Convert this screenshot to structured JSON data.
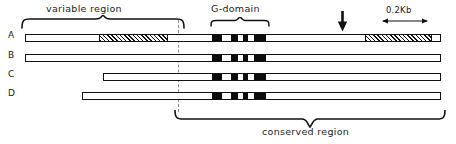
{
  "figure": {
    "title_labels": {
      "variable_region": "variable region",
      "g_domain": "G-domain",
      "conserved_region": "conserved region",
      "scale": "0.2Kb"
    },
    "rows": [
      {
        "id": "A",
        "label": "A",
        "bar": {
          "left": 25,
          "width": 416,
          "top": 34
        },
        "segments": [
          {
            "kind": "hatch",
            "left": 73,
            "width": 67
          },
          {
            "kind": "black",
            "left": 186,
            "width": 10
          },
          {
            "kind": "black",
            "left": 205,
            "width": 7
          },
          {
            "kind": "black",
            "left": 217,
            "width": 5
          },
          {
            "kind": "black",
            "left": 228,
            "width": 12
          },
          {
            "kind": "hatch",
            "left": 339,
            "width": 65
          }
        ]
      },
      {
        "id": "B",
        "label": "B",
        "bar": {
          "left": 25,
          "width": 416,
          "top": 54
        },
        "segments": [
          {
            "kind": "black",
            "left": 186,
            "width": 10
          },
          {
            "kind": "black",
            "left": 205,
            "width": 7
          },
          {
            "kind": "black",
            "left": 217,
            "width": 5
          },
          {
            "kind": "black",
            "left": 228,
            "width": 12
          }
        ]
      },
      {
        "id": "C",
        "label": "C",
        "bar": {
          "left": 103,
          "width": 338,
          "top": 73
        },
        "segments": [
          {
            "kind": "black",
            "left": 108,
            "width": 10
          },
          {
            "kind": "black",
            "left": 127,
            "width": 7
          },
          {
            "kind": "black",
            "left": 139,
            "width": 5
          },
          {
            "kind": "black",
            "left": 150,
            "width": 12
          }
        ]
      },
      {
        "id": "D",
        "label": "D",
        "bar": {
          "left": 82,
          "width": 359,
          "top": 92
        },
        "segments": [
          {
            "kind": "black",
            "left": 129,
            "width": 10
          },
          {
            "kind": "black",
            "left": 148,
            "width": 7
          },
          {
            "kind": "black",
            "left": 160,
            "width": 5
          },
          {
            "kind": "black",
            "left": 171,
            "width": 12
          }
        ]
      }
    ],
    "annotations": {
      "cleavage_arrow_x": 342,
      "dashed_line_x": 178
    }
  }
}
